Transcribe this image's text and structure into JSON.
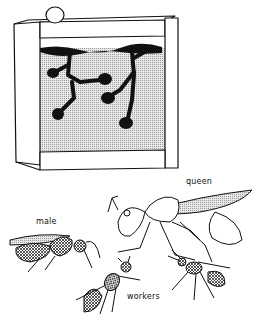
{
  "illustration": {
    "subject": "ant farm and ant castes",
    "ink_color": "#111111",
    "fill_color": "#cfcfcf",
    "dark_fill": "#111111"
  },
  "labels": {
    "queen": "queen",
    "male": "male",
    "workers": "workers"
  }
}
